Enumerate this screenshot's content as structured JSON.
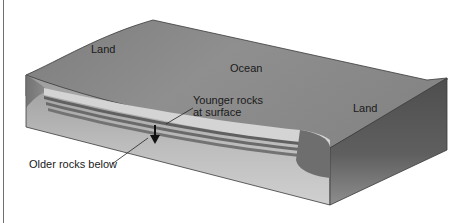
{
  "diagram": {
    "labels": {
      "land_left": "Land",
      "ocean": "Ocean",
      "land_right": "Land",
      "younger_line1": "Younger rocks",
      "younger_line2": "at surface",
      "older": "Older rocks below"
    },
    "colors": {
      "top_surface": "#8a8a8a",
      "front_face_light": "#c8c8c8",
      "front_face_dark": "#9a9a9a",
      "right_face": "#5c5c5c",
      "sediment_light": "#d6d6d6",
      "sediment_band": "#6a6a6a",
      "outline": "#3a3a3a",
      "arrow": "#111111"
    }
  }
}
